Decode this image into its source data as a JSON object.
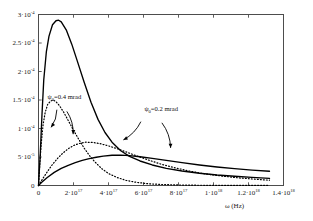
{
  "chart_data": {
    "type": "line",
    "title": "",
    "xlabel": "ω (Hz)",
    "ylabel": "",
    "xlim": [
      0,
      1.4e+18
    ],
    "ylim": [
      0,
      0.0003
    ],
    "grid": false,
    "legend_position": "inline-annotations",
    "x_ticks": [
      {
        "value": 0,
        "label": "0"
      },
      {
        "value": 2e+17,
        "mantissa": "2·10",
        "exponent": "17"
      },
      {
        "value": 4e+17,
        "mantissa": "4·10",
        "exponent": "17"
      },
      {
        "value": 6e+17,
        "mantissa": "6·10",
        "exponent": "17"
      },
      {
        "value": 8e+17,
        "mantissa": "8·10",
        "exponent": "17"
      },
      {
        "value": 1e+18,
        "mantissa": "1·10",
        "exponent": "18"
      },
      {
        "value": 1.2e+18,
        "mantissa": "1.2·10",
        "exponent": "18"
      },
      {
        "value": 1.4e+18,
        "mantissa": "1.4·10",
        "exponent": "18"
      }
    ],
    "y_ticks": [
      {
        "value": 0,
        "label": "0"
      },
      {
        "value": 5e-05,
        "mantissa": "5·10",
        "exponent": "-5"
      },
      {
        "value": 0.0001,
        "mantissa": "1·10",
        "exponent": "-4"
      },
      {
        "value": 0.00015,
        "mantissa": "1.5·10",
        "exponent": "-4"
      },
      {
        "value": 0.0002,
        "mantissa": "2·10",
        "exponent": "-4"
      },
      {
        "value": 0.00025,
        "mantissa": "2.5·10",
        "exponent": "-4"
      },
      {
        "value": 0.0003,
        "mantissa": "3·10",
        "exponent": "-4"
      }
    ],
    "series": [
      {
        "name": "solid-tall-peak",
        "style": "solid",
        "peak_x": 1.15e+17,
        "peak_y": 0.00029,
        "points": [
          [
            0.0,
            0.0
          ],
          [
            1e+16,
            5.5e-05
          ],
          [
            2e+16,
            0.000125
          ],
          [
            3e+16,
            0.000185
          ],
          [
            4.5e+16,
            0.000235
          ],
          [
            6e+16,
            0.000262
          ],
          [
            8e+16,
            0.000282
          ],
          [
            1e+17,
            0.000289
          ],
          [
            1.15e+17,
            0.00029
          ],
          [
            1.3e+17,
            0.000287
          ],
          [
            1.6e+17,
            0.000272
          ],
          [
            1.9e+17,
            0.000248
          ],
          [
            2.2e+17,
            0.00022
          ],
          [
            2.6e+17,
            0.000182
          ],
          [
            3e+17,
            0.000146
          ],
          [
            3.4e+17,
            0.000116
          ],
          [
            3.8e+17,
            9.3e-05
          ],
          [
            4.2e+17,
            7.6e-05
          ],
          [
            4.7e+17,
            6.1e-05
          ],
          [
            5.2e+17,
            5.1e-05
          ],
          [
            5.8e+17,
            4.3e-05
          ],
          [
            6.5e+17,
            3.6e-05
          ],
          [
            7.3e+17,
            3e-05
          ],
          [
            8.2e+17,
            2.55e-05
          ],
          [
            9.2e+17,
            2.15e-05
          ],
          [
            1.02e+18,
            1.85e-05
          ],
          [
            1.12e+18,
            1.62e-05
          ],
          [
            1.22e+18,
            1.42e-05
          ],
          [
            1.32e+18,
            1.24e-05
          ]
        ]
      },
      {
        "name": "solid-broad-low",
        "style": "solid",
        "peak_x": 4.2e+17,
        "peak_y": 5.3e-05,
        "points": [
          [
            0.0,
            0.0
          ],
          [
            2e+16,
            6e-06
          ],
          [
            5e+16,
            1.4e-05
          ],
          [
            9e+16,
            2.3e-05
          ],
          [
            1.3e+17,
            3e-05
          ],
          [
            1.7e+17,
            3.55e-05
          ],
          [
            2.1e+17,
            4e-05
          ],
          [
            2.5e+17,
            4.4e-05
          ],
          [
            2.9e+17,
            4.7e-05
          ],
          [
            3.3e+17,
            4.95e-05
          ],
          [
            3.7e+17,
            5.15e-05
          ],
          [
            4.2e+17,
            5.3e-05
          ],
          [
            4.7e+17,
            5.32e-05
          ],
          [
            5.2e+17,
            5.25e-05
          ],
          [
            5.8e+17,
            5.05e-05
          ],
          [
            6.5e+17,
            4.75e-05
          ],
          [
            7.3e+17,
            4.4e-05
          ],
          [
            8.2e+17,
            4e-05
          ],
          [
            9.2e+17,
            3.6e-05
          ],
          [
            1.02e+18,
            3.25e-05
          ],
          [
            1.12e+18,
            2.95e-05
          ],
          [
            1.22e+18,
            2.7e-05
          ],
          [
            1.32e+18,
            2.5e-05
          ]
        ]
      },
      {
        "name": "dotted-early-peak",
        "style": "dotted",
        "peak_x": 8.5e+16,
        "peak_y": 0.00015,
        "points": [
          [
            0.0,
            0.0
          ],
          [
            8000000000000000.0,
            4e-05
          ],
          [
            1.6e+16,
            7.5e-05
          ],
          [
            2.6e+16,
            0.000106
          ],
          [
            3.8e+16,
            0.000128
          ],
          [
            5.2e+16,
            0.000142
          ],
          [
            6.8e+16,
            0.000148
          ],
          [
            8.5e+16,
            0.00015
          ],
          [
            1e+17,
            0.000147
          ],
          [
            1.2e+17,
            0.00014
          ],
          [
            1.45e+17,
            0.000128
          ],
          [
            1.7e+17,
            0.000114
          ],
          [
            2e+17,
            9.7e-05
          ],
          [
            2.3e+17,
            8.1e-05
          ],
          [
            2.6e+17,
            6.6e-05
          ],
          [
            2.9e+17,
            5.3e-05
          ],
          [
            3.2e+17,
            4.2e-05
          ],
          [
            3.6e+17,
            3e-05
          ],
          [
            4e+17,
            2.1e-05
          ],
          [
            4.5e+17,
            1.4e-05
          ],
          [
            5e+17,
            9e-06
          ],
          [
            5.6e+17,
            5.5e-06
          ],
          [
            6.3e+17,
            3e-06
          ],
          [
            7e+17,
            1.8e-06
          ],
          [
            8e+17,
            9e-07
          ],
          [
            9e+17,
            5e-07
          ],
          [
            1.05e+18,
            2e-07
          ],
          [
            1.2e+18,
            1e-07
          ],
          [
            1.32e+18,
            5e-08
          ]
        ]
      },
      {
        "name": "dotted-broad-peak",
        "style": "dotted",
        "peak_x": 2.7e+17,
        "peak_y": 7.6e-05,
        "points": [
          [
            0.0,
            0.0
          ],
          [
            2e+16,
            1e-05
          ],
          [
            5e+16,
            2.4e-05
          ],
          [
            8e+16,
            3.7e-05
          ],
          [
            1.1e+17,
            4.8e-05
          ],
          [
            1.4e+17,
            5.7e-05
          ],
          [
            1.7e+17,
            6.45e-05
          ],
          [
            2e+17,
            7e-05
          ],
          [
            2.3e+17,
            7.35e-05
          ],
          [
            2.7e+17,
            7.6e-05
          ],
          [
            3.1e+17,
            7.55e-05
          ],
          [
            3.5e+17,
            7.35e-05
          ],
          [
            4e+17,
            6.95e-05
          ],
          [
            4.5e+17,
            6.45e-05
          ],
          [
            5e+17,
            5.9e-05
          ],
          [
            5.6e+17,
            5.2e-05
          ],
          [
            6.3e+17,
            4.45e-05
          ],
          [
            7e+17,
            3.75e-05
          ],
          [
            7.8e+17,
            3.1e-05
          ],
          [
            8.6e+17,
            2.55e-05
          ],
          [
            9.5e+17,
            2.05e-05
          ],
          [
            1.05e+18,
            1.65e-05
          ],
          [
            1.15e+18,
            1.32e-05
          ],
          [
            1.25e+18,
            1.07e-05
          ],
          [
            1.32e+18,
            9.3e-06
          ]
        ]
      }
    ],
    "annotations": [
      {
        "name": "psi-0-4-mrad",
        "symbol": "ψ",
        "subscript": "0",
        "text": "=0.4 mrad",
        "label_x": 5.2e+16,
        "label_y": 0.000152,
        "arrows": [
          {
            "from": [
              1.05e+17,
              0.000133
            ],
            "to": [
              7.2e+16,
              0.000102
            ]
          },
          {
            "from": [
              1.62e+17,
              0.00013
            ],
            "to": [
              1.98e+17,
              9e-05
            ]
          }
        ]
      },
      {
        "name": "psi-0-2-mrad",
        "symbol": "ψ",
        "subscript": "0",
        "text": "=0.2 mrad",
        "label_x": 6.05e+17,
        "label_y": 0.00013,
        "arrows": [
          {
            "from": [
              5.85e+17,
              0.000112
            ],
            "to": [
              4.85e+17,
              8e-05
            ]
          },
          {
            "from": [
              7.05e+17,
              0.00011
            ],
            "to": [
              7.55e+17,
              6.6e-05
            ]
          }
        ]
      }
    ]
  }
}
